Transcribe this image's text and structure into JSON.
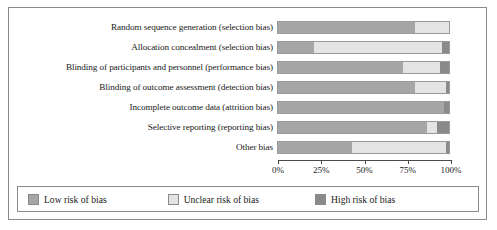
{
  "chart_data": {
    "type": "bar",
    "title": "",
    "subtitle": "",
    "xlabel": "",
    "ylabel": "",
    "orientation": "horizontal",
    "stacked": true,
    "normalized": true,
    "grid": false,
    "legend_position": "bottom",
    "xlim": [
      0,
      100
    ],
    "xticks": [
      0,
      25,
      50,
      75,
      100
    ],
    "xtick_labels": [
      "0%",
      "25%",
      "50%",
      "75%",
      "100%"
    ],
    "categories": [
      "Random sequence generation (selection bias)",
      "Allocation concealment (selection bias)",
      "Blinding of participants and personnel (performance bias)",
      "Blinding of outcome assessment (detection bias)",
      "Incomplete outcome data (attrition bias)",
      "Selective reporting (reporting bias)",
      "Other bias"
    ],
    "series": [
      {
        "name": "Low risk of bias",
        "color": "#a6a6a6",
        "values": [
          80,
          21,
          73,
          80,
          97,
          87,
          43
        ]
      },
      {
        "name": "Unclear risk of bias",
        "color": "#e4e4e4",
        "values": [
          20,
          75,
          22,
          18,
          0,
          6,
          55
        ]
      },
      {
        "name": "High risk of bias",
        "color": "#8a8a8a",
        "values": [
          0,
          4,
          5,
          2,
          3,
          7,
          2
        ]
      }
    ]
  },
  "axis": {
    "ticks": [
      {
        "label": "0%",
        "value": 0
      },
      {
        "label": "25%",
        "value": 25
      },
      {
        "label": "50%",
        "value": 50
      },
      {
        "label": "75%",
        "value": 75
      },
      {
        "label": "100%",
        "value": 100
      }
    ]
  },
  "legend": {
    "items": [
      {
        "label": "Low risk of bias",
        "color": "#a6a6a6"
      },
      {
        "label": "Unclear risk of bias",
        "color": "#e4e4e4"
      },
      {
        "label": "High risk of bias",
        "color": "#8a8a8a"
      }
    ]
  }
}
